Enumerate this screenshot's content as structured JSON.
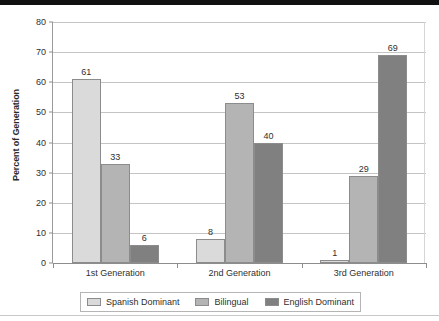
{
  "chart_data": {
    "type": "bar",
    "title": "",
    "xlabel": "",
    "ylabel": "Percent of Generation",
    "ylim": [
      0,
      80
    ],
    "ytick_step": 10,
    "yticks": [
      0,
      10,
      20,
      30,
      40,
      50,
      60,
      70,
      80
    ],
    "grid": true,
    "legend_position": "bottom",
    "categories": [
      "1st Generation",
      "2nd Generation",
      "3rd Generation"
    ],
    "series": [
      {
        "name": "Spanish Dominant",
        "color": "#dadada",
        "values": [
          61,
          8,
          1
        ]
      },
      {
        "name": "Bilingual",
        "color": "#b4b4b4",
        "values": [
          33,
          53,
          29
        ]
      },
      {
        "name": "English Dominant",
        "color": "#808080",
        "values": [
          6,
          40,
          69
        ]
      }
    ]
  },
  "axis": {
    "y_title": "Percent of Generation",
    "tick_0": "0",
    "tick_10": "10",
    "tick_20": "20",
    "tick_30": "30",
    "tick_40": "40",
    "tick_50": "50",
    "tick_60": "60",
    "tick_70": "70",
    "tick_80": "80"
  },
  "legend": {
    "items": [
      {
        "label": "Spanish Dominant"
      },
      {
        "label": "Bilingual"
      },
      {
        "label": "English Dominant"
      }
    ]
  },
  "colors": {
    "series_spanish_dominant": "#dadada",
    "series_bilingual": "#b4b4b4",
    "series_english_dominant": "#808080",
    "gridline": "#c4c4c4",
    "axis": "#8d8d8d",
    "text": "#2f2f2f"
  }
}
